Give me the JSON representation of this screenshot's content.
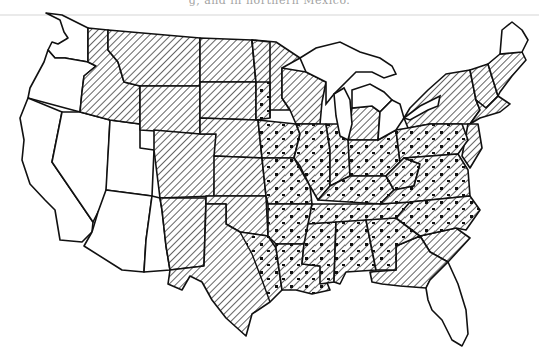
{
  "caption": {
    "text": "g, and in northern Mexico."
  },
  "map": {
    "title": "United States regional distribution map",
    "patterns": {
      "white": "no shading",
      "hatch": "diagonal hatching",
      "hatch_dots": "diagonal hatching with dots"
    },
    "colors": {
      "ink": "#111111",
      "paper": "#ffffff"
    },
    "regions": {
      "unshaded": [
        "Washington",
        "Oregon",
        "California",
        "Nevada",
        "Utah",
        "Arizona",
        "western New Mexico",
        "Florida",
        "northern Maine",
        "northern Michigan"
      ],
      "hatched": [
        "northern Idaho",
        "eastern Oregon",
        "Montana",
        "Wyoming",
        "Colorado",
        "North Dakota",
        "South Dakota",
        "Nebraska",
        "Kansas",
        "Oklahoma",
        "Texas",
        "eastern New Mexico",
        "Minnesota",
        "Wisconsin",
        "southern Michigan",
        "New York",
        "Vermont",
        "New Hampshire",
        "southern Maine",
        "Massachusetts",
        "Connecticut",
        "Rhode Island",
        "New Jersey",
        "Delaware",
        "Maryland",
        "South Carolina",
        "southern Georgia",
        "Florida panhandle"
      ],
      "hatched_with_dots": [
        "eastern Dakotas",
        "eastern Nebraska",
        "eastern Kansas",
        "eastern Oklahoma",
        "east Texas",
        "Iowa",
        "Missouri",
        "Arkansas",
        "Louisiana",
        "Illinois",
        "Indiana",
        "Ohio",
        "Kentucky",
        "Tennessee",
        "Mississippi",
        "Alabama",
        "northern Georgia",
        "Pennsylvania",
        "West Virginia",
        "Virginia",
        "North Carolina"
      ]
    }
  }
}
